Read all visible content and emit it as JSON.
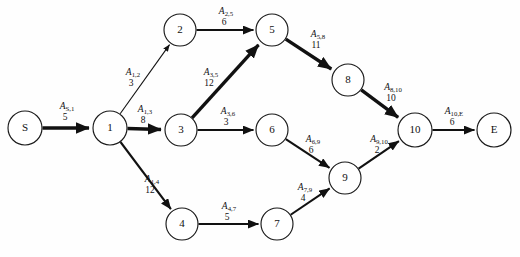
{
  "diagram": {
    "type": "directed-network-graph",
    "title": "",
    "nodes": [
      {
        "id": "S",
        "label": "S",
        "x": 25,
        "y": 128,
        "r": 17
      },
      {
        "id": "1",
        "label": "1",
        "x": 110,
        "y": 128,
        "r": 17
      },
      {
        "id": "2",
        "label": "2",
        "x": 180,
        "y": 30,
        "r": 16
      },
      {
        "id": "3",
        "label": "3",
        "x": 181,
        "y": 130,
        "r": 16
      },
      {
        "id": "4",
        "label": "4",
        "x": 182,
        "y": 224,
        "r": 16
      },
      {
        "id": "5",
        "label": "5",
        "x": 272,
        "y": 30,
        "r": 16
      },
      {
        "id": "6",
        "label": "6",
        "x": 272,
        "y": 130,
        "r": 16
      },
      {
        "id": "7",
        "label": "7",
        "x": 277,
        "y": 224,
        "r": 16
      },
      {
        "id": "8",
        "label": "8",
        "x": 348,
        "y": 80,
        "r": 16
      },
      {
        "id": "9",
        "label": "9",
        "x": 345,
        "y": 178,
        "r": 16
      },
      {
        "id": "10",
        "label": "10",
        "x": 415,
        "y": 130,
        "r": 17
      },
      {
        "id": "E",
        "label": "E",
        "x": 494,
        "y": 130,
        "r": 17
      }
    ],
    "edges": [
      {
        "from": "S",
        "to": "1",
        "name": "A",
        "sub": "S,1",
        "weight": "5",
        "thickness": "thick",
        "label_x": 67,
        "label_y": 109
      },
      {
        "from": "1",
        "to": "2",
        "name": "A",
        "sub": "1,2",
        "weight": "3",
        "thickness": "thin",
        "label_x": 133,
        "label_y": 75
      },
      {
        "from": "1",
        "to": "3",
        "name": "A",
        "sub": "1,3",
        "weight": "8",
        "thickness": "thick",
        "label_x": 145,
        "label_y": 112
      },
      {
        "from": "1",
        "to": "4",
        "name": "A",
        "sub": "1,4",
        "weight": "12",
        "thickness": "medium",
        "label_x": 152,
        "label_y": 182
      },
      {
        "from": "2",
        "to": "5",
        "name": "A",
        "sub": "2,5",
        "weight": "6",
        "thickness": "medium",
        "label_x": 226,
        "label_y": 14
      },
      {
        "from": "3",
        "to": "5",
        "name": "A",
        "sub": "3,5",
        "weight": "12",
        "thickness": "thick",
        "label_x": 211,
        "label_y": 75
      },
      {
        "from": "3",
        "to": "6",
        "name": "A",
        "sub": "3,6",
        "weight": "3",
        "thickness": "medium",
        "label_x": 228,
        "label_y": 114
      },
      {
        "from": "4",
        "to": "7",
        "name": "A",
        "sub": "4,7",
        "weight": "5",
        "thickness": "medium",
        "label_x": 229,
        "label_y": 209
      },
      {
        "from": "5",
        "to": "8",
        "name": "A",
        "sub": "5,8",
        "weight": "11",
        "thickness": "thick",
        "label_x": 318,
        "label_y": 37
      },
      {
        "from": "6",
        "to": "9",
        "name": "A",
        "sub": "6,9",
        "weight": "6",
        "thickness": "medium",
        "label_x": 313,
        "label_y": 142
      },
      {
        "from": "7",
        "to": "9",
        "name": "A",
        "sub": "7,9",
        "weight": "4",
        "thickness": "medium",
        "label_x": 305,
        "label_y": 190
      },
      {
        "from": "8",
        "to": "10",
        "name": "A",
        "sub": "8,10",
        "weight": "10",
        "thickness": "thick",
        "label_x": 393,
        "label_y": 90
      },
      {
        "from": "9",
        "to": "10",
        "name": "A",
        "sub": "9,10",
        "weight": "2",
        "thickness": "medium",
        "label_x": 379,
        "label_y": 142
      },
      {
        "from": "10",
        "to": "E",
        "name": "A",
        "sub": "10,E",
        "weight": "6",
        "thickness": "medium",
        "label_x": 454,
        "label_y": 114
      }
    ],
    "colors": {
      "node_stroke": "#1a1a1a",
      "node_fill": "#ffffff",
      "edge_stroke": "#111111",
      "background": "#fefefe"
    }
  }
}
